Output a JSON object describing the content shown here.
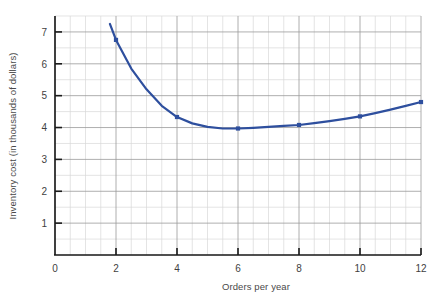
{
  "chart_data": {
    "type": "line",
    "title": "",
    "xlabel": "Orders per year",
    "ylabel": "Inventory cost (in thousands of dollars)",
    "xlim": [
      0,
      12
    ],
    "ylim": [
      0,
      7.5
    ],
    "xticks": [
      0,
      2,
      4,
      6,
      8,
      10,
      12
    ],
    "xtick_labels": [
      "0",
      "2",
      "4",
      "6",
      "8",
      "10",
      "12"
    ],
    "yticks": [
      1,
      2,
      3,
      4,
      5,
      6,
      7
    ],
    "ytick_labels": [
      "1",
      "2",
      "3",
      "4",
      "5",
      "6",
      "7"
    ],
    "grid": true,
    "grid_minor_step_x": 0.5,
    "grid_minor_step_y": 0.5,
    "legend": "none",
    "series": [
      {
        "name": "Inventory cost",
        "color": "#2e4f9e",
        "marker": "square",
        "x": [
          2,
          4,
          6,
          8,
          10,
          12
        ],
        "values": [
          6.75,
          4.33,
          3.97,
          4.08,
          4.35,
          4.8
        ],
        "curve_x": [
          1.8,
          2,
          2.5,
          3,
          3.5,
          4,
          4.5,
          5,
          5.5,
          6,
          6.5,
          7,
          7.5,
          8,
          8.5,
          9,
          9.5,
          10,
          10.5,
          11,
          11.5,
          12
        ],
        "curve_y": [
          7.25,
          6.75,
          5.85,
          5.2,
          4.68,
          4.33,
          4.13,
          4.02,
          3.97,
          3.97,
          3.99,
          4.02,
          4.05,
          4.08,
          4.14,
          4.2,
          4.27,
          4.35,
          4.45,
          4.56,
          4.68,
          4.8
        ]
      }
    ]
  },
  "colors": {
    "series": "#2e4f9e",
    "axis": "#1a1a1a",
    "major_grid": "#9a9a9a",
    "minor_grid": "#d8d8d8",
    "text": "#3f3f3f",
    "background": "#ffffff"
  }
}
